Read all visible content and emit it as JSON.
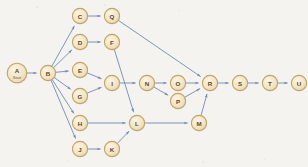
{
  "diagram": {
    "background_color": "#f4f3ef",
    "node_fill": "#f3e4c3",
    "node_fill_highlight": "#fbf3df",
    "node_stroke": "#c2a368",
    "node_text_color": "#5a4a2e",
    "edge_color": "#6f8bb8",
    "node_radius": 7.6,
    "start_node_radius": 9.8,
    "label_font_size": 6.2,
    "sub_font_size": 4.0,
    "edge_width": 0.9,
    "arrow_size": 3.2,
    "nodes": [
      {
        "id": "A",
        "label": "A",
        "sublabel": "Start",
        "x": 17,
        "y": 73,
        "radius": 9.8,
        "role": "start"
      },
      {
        "id": "B",
        "label": "B",
        "sublabel": "",
        "x": 48,
        "y": 73,
        "radius": 7.6,
        "role": "hub"
      },
      {
        "id": "C",
        "label": "C",
        "sublabel": "",
        "x": 80,
        "y": 16,
        "radius": 7.6,
        "role": "task"
      },
      {
        "id": "Q",
        "label": "Q",
        "sublabel": "",
        "x": 112,
        "y": 16,
        "radius": 7.6,
        "role": "task"
      },
      {
        "id": "D",
        "label": "D",
        "sublabel": "",
        "x": 80,
        "y": 42,
        "radius": 7.6,
        "role": "task"
      },
      {
        "id": "F",
        "label": "F",
        "sublabel": "",
        "x": 112,
        "y": 42,
        "radius": 7.6,
        "role": "task"
      },
      {
        "id": "E",
        "label": "E",
        "sublabel": "",
        "x": 80,
        "y": 70,
        "radius": 7.6,
        "role": "task"
      },
      {
        "id": "G",
        "label": "G",
        "sublabel": "",
        "x": 80,
        "y": 96,
        "radius": 7.6,
        "role": "task"
      },
      {
        "id": "I",
        "label": "I",
        "sublabel": "",
        "x": 112,
        "y": 83,
        "radius": 7.6,
        "role": "task"
      },
      {
        "id": "H",
        "label": "H",
        "sublabel": "",
        "x": 80,
        "y": 123,
        "radius": 7.6,
        "role": "task"
      },
      {
        "id": "J",
        "label": "J",
        "sublabel": "",
        "x": 80,
        "y": 149,
        "radius": 7.6,
        "role": "task"
      },
      {
        "id": "K",
        "label": "K",
        "sublabel": "",
        "x": 112,
        "y": 149,
        "radius": 7.6,
        "role": "task"
      },
      {
        "id": "L",
        "label": "L",
        "sublabel": "",
        "x": 137,
        "y": 123,
        "radius": 7.6,
        "role": "task"
      },
      {
        "id": "N",
        "label": "N",
        "sublabel": "",
        "x": 147,
        "y": 83,
        "radius": 7.6,
        "role": "task"
      },
      {
        "id": "O",
        "label": "O",
        "sublabel": "",
        "x": 178,
        "y": 83,
        "radius": 7.6,
        "role": "task"
      },
      {
        "id": "P",
        "label": "P",
        "sublabel": "",
        "x": 178,
        "y": 101,
        "radius": 7.6,
        "role": "task"
      },
      {
        "id": "M",
        "label": "M",
        "sublabel": "",
        "x": 199,
        "y": 123,
        "radius": 7.6,
        "role": "task"
      },
      {
        "id": "R",
        "label": "R",
        "sublabel": "",
        "x": 210,
        "y": 83,
        "radius": 7.6,
        "role": "task"
      },
      {
        "id": "S",
        "label": "S",
        "sublabel": "",
        "x": 240,
        "y": 83,
        "radius": 7.6,
        "role": "task"
      },
      {
        "id": "T",
        "label": "T",
        "sublabel": "",
        "x": 270,
        "y": 83,
        "radius": 7.6,
        "role": "task"
      },
      {
        "id": "U",
        "label": "U",
        "sublabel": "",
        "x": 299,
        "y": 83,
        "radius": 7.6,
        "role": "end"
      }
    ],
    "edges": [
      {
        "from": "A",
        "to": "B"
      },
      {
        "from": "B",
        "to": "C"
      },
      {
        "from": "B",
        "to": "D"
      },
      {
        "from": "B",
        "to": "E"
      },
      {
        "from": "B",
        "to": "G"
      },
      {
        "from": "B",
        "to": "H"
      },
      {
        "from": "B",
        "to": "J"
      },
      {
        "from": "C",
        "to": "Q"
      },
      {
        "from": "D",
        "to": "F"
      },
      {
        "from": "E",
        "to": "I"
      },
      {
        "from": "G",
        "to": "I"
      },
      {
        "from": "F",
        "to": "L"
      },
      {
        "from": "I",
        "to": "N"
      },
      {
        "from": "H",
        "to": "L"
      },
      {
        "from": "J",
        "to": "K"
      },
      {
        "from": "K",
        "to": "L"
      },
      {
        "from": "N",
        "to": "O"
      },
      {
        "from": "N",
        "to": "P"
      },
      {
        "from": "O",
        "to": "R"
      },
      {
        "from": "P",
        "to": "R"
      },
      {
        "from": "Q",
        "to": "R"
      },
      {
        "from": "L",
        "to": "M"
      },
      {
        "from": "M",
        "to": "R"
      },
      {
        "from": "R",
        "to": "S"
      },
      {
        "from": "S",
        "to": "T"
      },
      {
        "from": "T",
        "to": "U"
      }
    ]
  }
}
